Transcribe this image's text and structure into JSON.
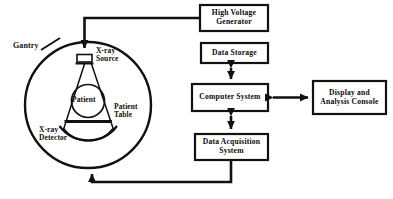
{
  "diagram": {
    "type": "block-diagram",
    "stroke_color": "#111111",
    "background_color": "#ffffff",
    "gantry": {
      "label": "Gantry",
      "source_label": "X-ray\nSource",
      "patient_label": "Patient",
      "table_label": "Patient\nTable",
      "detector_label": "X-ray\nDetector"
    },
    "boxes": [
      {
        "id": "high-voltage-generator",
        "label": "High Voltage\nGenerator"
      },
      {
        "id": "data-storage",
        "label": "Data Storage"
      },
      {
        "id": "computer-system",
        "label": "Computer  System"
      },
      {
        "id": "display-analysis-console",
        "label": "Display and\nAnalysis Console"
      },
      {
        "id": "data-acquisition-system",
        "label": "Data  Acquisition\nSystem"
      }
    ],
    "connections": [
      {
        "id": "hvg-to-xray-source",
        "from": "high-voltage-generator",
        "to": "x-ray-source",
        "arrow": "single"
      },
      {
        "id": "data-storage-to-computer",
        "from": "data-storage",
        "to": "computer-system",
        "arrow": "double"
      },
      {
        "id": "computer-to-display",
        "from": "computer-system",
        "to": "display-analysis-console",
        "arrow": "double"
      },
      {
        "id": "computer-to-daq",
        "from": "computer-system",
        "to": "data-acquisition-system",
        "arrow": "double"
      },
      {
        "id": "detector-to-daq",
        "from": "x-ray-detector",
        "to": "data-acquisition-system",
        "arrow": "single"
      }
    ]
  }
}
